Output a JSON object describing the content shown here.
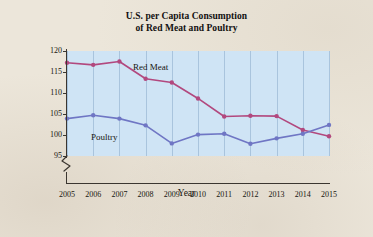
{
  "figure": {
    "title_line1": "U.S. per Capita Consumption",
    "title_line2": "of Red Meat and Poultry",
    "background_color": "#ece6da",
    "plot_background_color": "#cfe4f5",
    "axis_break_symbol": "axis-break"
  },
  "chart_data": {
    "type": "line",
    "title": "U.S. per Capita Consumption of Red Meat and Poultry",
    "xlabel": "Year",
    "ylabel": "Pounds",
    "categories": [
      "2005",
      "2006",
      "2007",
      "2008",
      "2009",
      "2010",
      "2011",
      "2012",
      "2013",
      "2014",
      "2015"
    ],
    "x": [
      2005,
      2006,
      2007,
      2008,
      2009,
      2010,
      2011,
      2012,
      2013,
      2014,
      2015
    ],
    "xlim": [
      2005,
      2015
    ],
    "ylim": [
      95,
      120
    ],
    "yticks": [
      95,
      100,
      105,
      110,
      115,
      120
    ],
    "xticks": [
      "2005",
      "2006",
      "2007",
      "2008",
      "2009",
      "2010",
      "2011",
      "2012",
      "2013",
      "2014",
      "2015"
    ],
    "grid": "vertical",
    "legend": "inline-annotations",
    "axis_break": true,
    "series": [
      {
        "name": "Red Meat",
        "color": "#b2487e",
        "label_position": "above-line-near-2008",
        "values": [
          117.2,
          116.7,
          117.5,
          113.4,
          112.5,
          108.7,
          104.4,
          104.6,
          104.5,
          101.2,
          99.7
        ]
      },
      {
        "name": "Poultry",
        "color": "#6f76c4",
        "label_position": "below-line-near-2007",
        "values": [
          103.9,
          104.7,
          103.9,
          102.3,
          98.0,
          100.1,
          100.3,
          97.9,
          99.2,
          100.3,
          102.4
        ]
      }
    ]
  }
}
